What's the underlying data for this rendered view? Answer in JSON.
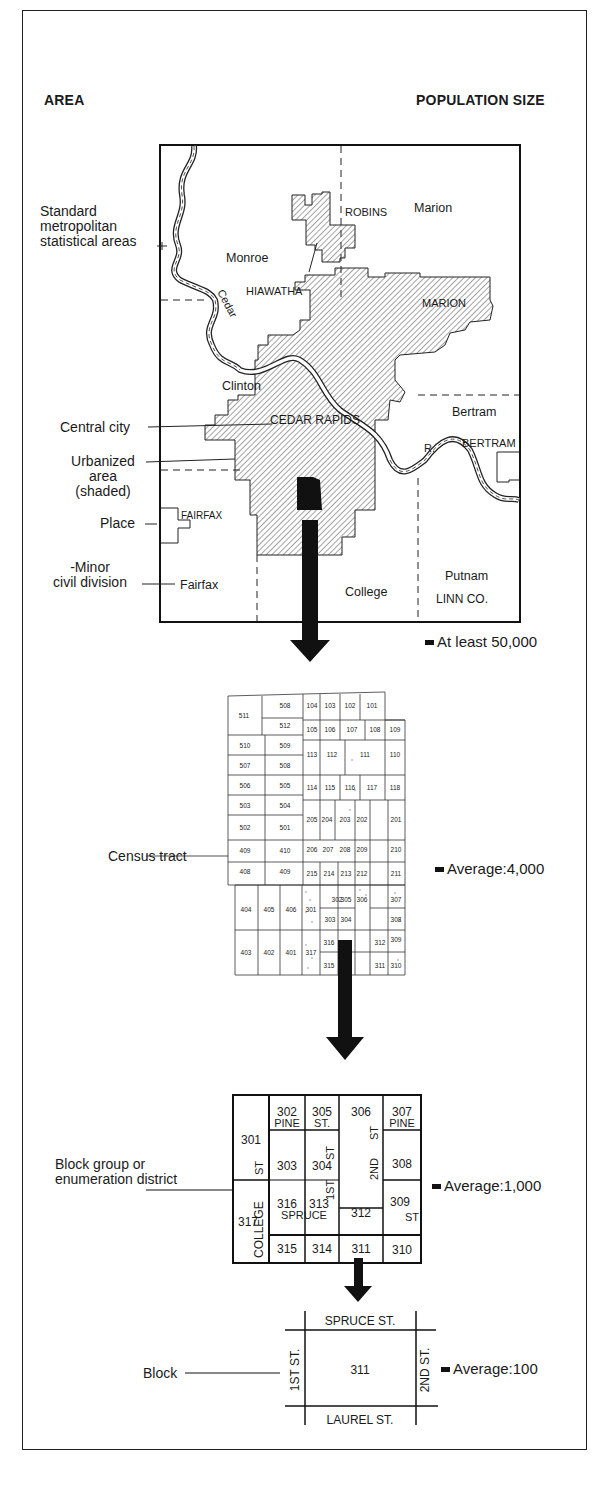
{
  "headers": {
    "area": "AREA",
    "population": "POPULATION SIZE"
  },
  "levels": [
    {
      "id": "smsa-map",
      "population_label": "At least 50,000",
      "area_labels": {
        "smsa": "Standard metropolitan statistical areas",
        "smsa_lines": [
          "Standard",
          "metropolitan",
          "statistical areas"
        ],
        "central_city": "Central city",
        "urbanized_lines": [
          "Urbanized",
          "area",
          "(shaded)"
        ],
        "place": "Place",
        "mcd_lines": [
          "-Minor",
          "civil division"
        ]
      },
      "map_labels": {
        "robins": "ROBINS",
        "marion_twp": "Marion",
        "monroe": "Monroe",
        "hiawatha": "HIAWATHA",
        "marion_city": "MARION",
        "river_cedar": "Cedar",
        "river_r": "R.",
        "clinton": "Clinton",
        "cedar_rapids": "CEDAR RAPIDS",
        "bertram_twp": "Bertram",
        "bertram_city": "BERTRAM",
        "fairfax_city": "FAIRFAX",
        "fairfax_twp": "Fairfax",
        "college": "College",
        "putnam": "Putnam",
        "linn_co": "LINN CO."
      }
    },
    {
      "id": "census-tract-map",
      "area_label": "Census tract",
      "population_label": "Average:4,000",
      "tracts_upper": [
        "511",
        "508",
        "512",
        "510",
        "509",
        "507",
        "508",
        "506",
        "505",
        "503",
        "504",
        "502",
        "501",
        "409",
        "410",
        "408",
        "409",
        "104",
        "103",
        "102",
        "101",
        "105",
        "106",
        "107",
        "108",
        "109",
        "113",
        "112",
        "111",
        "110",
        "114",
        "115",
        "116",
        "117",
        "118",
        "205",
        "204",
        "203",
        "202",
        "201",
        "206",
        "207",
        "208",
        "209",
        "210",
        "215",
        "214",
        "213",
        "212",
        "211"
      ],
      "tracts_lower": [
        "404",
        "405",
        "406",
        "301",
        "302",
        "305",
        "306",
        "307",
        "303",
        "304",
        "308",
        "403",
        "402",
        "401",
        "317",
        "316",
        "313",
        "312",
        "309",
        "315",
        "314",
        "311",
        "310"
      ],
      "streets": [
        "COOK ST",
        "NEW",
        "AVE",
        "CHENERY ST",
        "ST",
        "FAYETTE AVE",
        "WILLIAMS ST",
        "ALLEN ST",
        "VINE ST",
        "HENRIETTA",
        "STATE HWY 4",
        "LAWRENCE",
        "COLLEGE",
        "CANEDY",
        "SCARRITT ST",
        "1ST ST",
        "2ND",
        "3RD",
        "CEDAR",
        "PINE ST",
        "LOWELL",
        "WHITTIER",
        "ROSEFIELD",
        "SPRUCE",
        "LAUREL"
      ]
    },
    {
      "id": "block-group-map",
      "area_label_lines": [
        "Block group or",
        "enumeration district"
      ],
      "population_label": "Average:1,000",
      "blocks": {
        "b301": "301",
        "b302": "302",
        "b305": "305",
        "b306": "306",
        "b307": "307",
        "b303": "303",
        "b304": "304",
        "b308": "308",
        "b317": "317",
        "b316": "316",
        "b313": "313",
        "b312": "312",
        "b309": "309",
        "b315": "315",
        "b314": "314",
        "b311": "311",
        "b310": "310"
      },
      "streets": {
        "pine1": "PINE",
        "st1": "ST.",
        "pine2": "PINE",
        "st_2nd_top": "ST",
        "st_college": "ST",
        "st_1st_top": "ST",
        "nd2": "2ND",
        "st_1st": "1ST",
        "college": "COLLEGE",
        "spruce": "SPRUCE",
        "st_309": "ST"
      }
    },
    {
      "id": "block-map",
      "area_label": "Block",
      "population_label": "Average:100",
      "block_number": "311",
      "streets": {
        "north": "SPRUCE ST.",
        "south": "LAUREL ST.",
        "west": "1ST ST.",
        "east": "2ND ST."
      }
    }
  ]
}
